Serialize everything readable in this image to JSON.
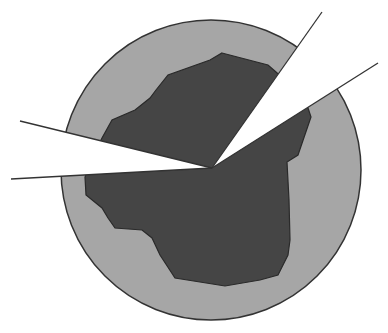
{
  "diagram": {
    "colors": {
      "background": "#ffffff",
      "circle_fill": "#a6a6a6",
      "region_fill": "#454545",
      "outline": "#333333",
      "wedge_fill": "#ffffff"
    },
    "circle": {
      "cx": 211,
      "cy": 170,
      "r": 150
    },
    "apex": {
      "x": 212,
      "y": 168
    },
    "wedges": [
      {
        "name": "upper-right-wedge",
        "line1_end": [
          322,
          12
        ],
        "line2_end": [
          378,
          63
        ]
      },
      {
        "name": "left-wedge",
        "line1_end": [
          20,
          121
        ],
        "line2_end": [
          11,
          179
        ]
      }
    ]
  }
}
